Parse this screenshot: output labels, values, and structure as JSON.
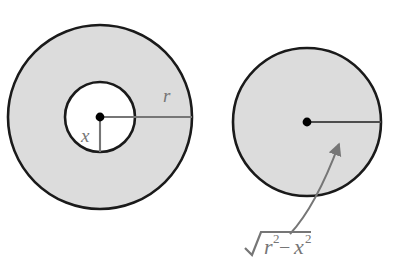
{
  "figure": {
    "background_color": "#ffffff",
    "fill_color": "#dcdcdc",
    "outline_color": "#1a1a1a",
    "label_color": "#767676",
    "leader_color": "#767676",
    "dot_color": "#000000",
    "left_diagram": {
      "name": "annulus-washer",
      "outer_circle": {
        "cx": 100,
        "cy": 117,
        "r": 92,
        "fill": "#dcdcdc",
        "stroke": "#1a1a1a"
      },
      "inner_circle": {
        "cx": 100,
        "cy": 117,
        "r": 35,
        "fill": "#ffffff",
        "stroke": "#1a1a1a"
      },
      "center_dot": {
        "cx": 100,
        "cy": 117,
        "r": 4
      },
      "radius_line": {
        "x1": 100,
        "y1": 117,
        "x2": 192,
        "y2": 117
      },
      "inner_radius_line": {
        "x1": 100,
        "y1": 117,
        "x2": 100,
        "y2": 152
      },
      "labels": {
        "outer_radius": "r",
        "inner_radius": "x"
      },
      "label_positions": {
        "outer_radius": {
          "x": 163,
          "y": 102
        },
        "inner_radius": {
          "x": 88,
          "y": 140
        }
      }
    },
    "right_diagram": {
      "name": "disk",
      "circle": {
        "cx": 307,
        "cy": 122,
        "r": 74,
        "fill": "#dcdcdc",
        "stroke": "#1a1a1a"
      },
      "center_dot": {
        "cx": 307,
        "cy": 122,
        "r": 4
      },
      "radius_line": {
        "x1": 307,
        "y1": 122,
        "x2": 381,
        "y2": 122
      },
      "leader_arrow": {
        "x1": 292,
        "y1": 232,
        "x2": 341,
        "y2": 140
      },
      "label": {
        "text": "√(r² − x²)",
        "radical_sign": "√",
        "base_1": "r",
        "exponent_1": "2",
        "operator": "−",
        "base_2": "x",
        "exponent_2": "2",
        "x": 246,
        "y": 252
      }
    }
  }
}
